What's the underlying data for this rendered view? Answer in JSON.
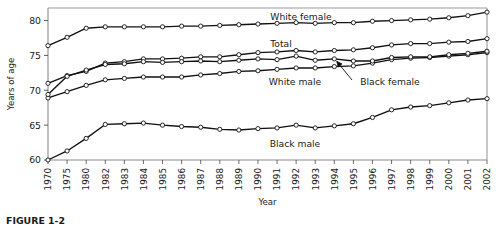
{
  "figure": {
    "caption": "FIGURE 1-2"
  },
  "chart_data": {
    "type": "line",
    "title": "",
    "xlabel": "Year",
    "ylabel": "Years of age",
    "xlim": [
      1970,
      2002
    ],
    "ylim": [
      60,
      81.8
    ],
    "yticks": [
      60,
      65,
      70,
      75,
      80
    ],
    "grid": false,
    "legend_position": "inline-annotations",
    "categories": [
      1970,
      1975,
      1980,
      1982,
      1983,
      1984,
      1985,
      1986,
      1987,
      1988,
      1989,
      1990,
      1991,
      1992,
      1993,
      1994,
      1995,
      1996,
      1997,
      1998,
      1999,
      2000,
      2001,
      2002
    ],
    "tick_labels": [
      "1970",
      "1975",
      "1980",
      "1982",
      "1983",
      "1984",
      "1985",
      "1986",
      "1987",
      "1988",
      "1989",
      "1990",
      "1991",
      "1992",
      "1993",
      "1994",
      "1995",
      "1996",
      "1997",
      "1998",
      "1999",
      "2000",
      "2001",
      "2002"
    ],
    "series": [
      {
        "name": "White female",
        "label": "White female",
        "values": [
          76.4,
          77.6,
          78.9,
          79.1,
          79.1,
          79.1,
          79.1,
          79.2,
          79.2,
          79.3,
          79.4,
          79.5,
          79.6,
          79.7,
          79.6,
          79.7,
          79.7,
          79.9,
          80.0,
          80.1,
          80.2,
          80.4,
          80.7,
          81.2
        ]
      },
      {
        "name": "Total",
        "label": "Total",
        "values": [
          71.0,
          72.1,
          72.7,
          73.9,
          74.1,
          74.5,
          74.5,
          74.6,
          74.8,
          74.8,
          75.1,
          75.4,
          75.5,
          75.7,
          75.5,
          75.7,
          75.8,
          76.1,
          76.5,
          76.7,
          76.7,
          76.9,
          77.0,
          77.4
        ]
      },
      {
        "name": "White male",
        "label": "White male",
        "values": [
          68.9,
          69.8,
          70.7,
          71.5,
          71.7,
          71.9,
          71.9,
          71.9,
          72.2,
          72.4,
          72.7,
          72.8,
          73.0,
          73.2,
          73.2,
          73.4,
          73.5,
          73.9,
          74.4,
          74.6,
          74.7,
          74.9,
          75.1,
          75.4
        ]
      },
      {
        "name": "Black female",
        "label": "Black female",
        "values": [
          69.4,
          72.0,
          72.9,
          73.7,
          73.8,
          74.1,
          74.0,
          74.1,
          74.2,
          74.1,
          74.3,
          74.5,
          74.4,
          74.9,
          74.3,
          74.5,
          74.2,
          74.2,
          74.7,
          74.8,
          74.8,
          75.1,
          75.3,
          75.6
        ]
      },
      {
        "name": "Black male",
        "label": "Black male",
        "values": [
          60.0,
          61.3,
          63.1,
          65.1,
          65.2,
          65.3,
          65.0,
          64.8,
          64.7,
          64.4,
          64.3,
          64.5,
          64.6,
          65.0,
          64.6,
          64.9,
          65.2,
          66.1,
          67.2,
          67.6,
          67.8,
          68.2,
          68.6,
          68.8
        ]
      }
    ],
    "annotations": [
      {
        "text": "White female",
        "series": "White female"
      },
      {
        "text": "Total",
        "series": "Total"
      },
      {
        "text": "White male",
        "series": "White male"
      },
      {
        "text": "Black female",
        "series": "Black female"
      },
      {
        "text": "Black male",
        "series": "Black male"
      }
    ]
  }
}
